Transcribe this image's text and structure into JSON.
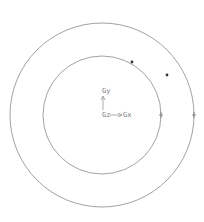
{
  "diagram": {
    "center": {
      "x": 102,
      "y": 115
    },
    "circles": [
      {
        "name": "outer-circle",
        "r": 92
      },
      {
        "name": "inner-circle",
        "r": 59
      }
    ],
    "axes": {
      "x_label": "Gx",
      "y_label": "Gy",
      "z_label": "Gz"
    },
    "markers": [
      {
        "type": "dot",
        "x": 132,
        "y": 62
      },
      {
        "type": "dot",
        "x": 167,
        "y": 75
      },
      {
        "type": "plus",
        "x": 161,
        "y": 115
      },
      {
        "type": "plus",
        "x": 194,
        "y": 115
      }
    ],
    "colors": {
      "line": "#888888",
      "marker": "#333333",
      "text": "#777777"
    }
  }
}
